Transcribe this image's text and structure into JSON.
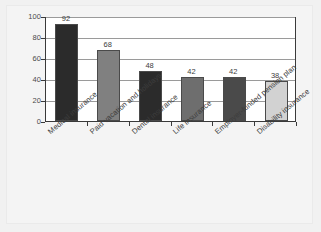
{
  "chart_data": {
    "type": "bar",
    "title": "",
    "subtitle": "",
    "xlabel": "",
    "ylabel": "",
    "ylim": [
      0,
      100
    ],
    "ytick_step": 20,
    "ytick_labels": [
      "0",
      "20",
      "40",
      "60",
      "80",
      "100"
    ],
    "grid": "horizontal",
    "legend": "none",
    "categories": [
      "Medical insurance",
      "Paid vacation and holidays",
      "Dental insurance",
      "Life insurance",
      "Employer-funded pension plan",
      "Disability insurance"
    ],
    "values": [
      92,
      68,
      48,
      42,
      42,
      38
    ],
    "value_labels": [
      "92",
      "68",
      "48",
      "42",
      "42",
      "38"
    ],
    "bar_colors": [
      "#2b2b2b",
      "#808080",
      "#2b2b2b",
      "#6e6e6e",
      "#4a4a4a",
      "#d2d2d2"
    ]
  },
  "colors": {
    "page_background": "#f1f1f1",
    "plot_background": "#ffffff",
    "axis": "#3a3a3a",
    "gridline": "#9a9a9a",
    "text": "#3d3d3d"
  }
}
